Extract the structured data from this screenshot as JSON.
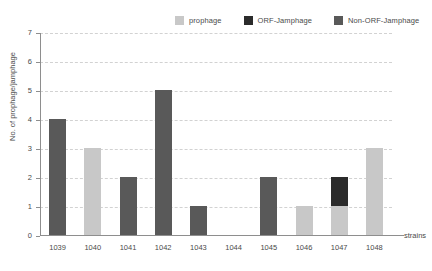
{
  "chart_data": {
    "type": "bar",
    "title": "",
    "subtitle": "",
    "xlabel": "strains",
    "ylabel": "No. of prophage/jamphage",
    "categories": [
      "1039",
      "1040",
      "1041",
      "1042",
      "1043",
      "1044",
      "1045",
      "1046",
      "1047",
      "1048"
    ],
    "ylim": [
      0,
      7
    ],
    "yticks": [
      "0",
      "1",
      "2",
      "3",
      "4",
      "5",
      "6",
      "7"
    ],
    "grid": "horizontal-dashed",
    "legend_position": "top-right",
    "stacked": true,
    "series": [
      {
        "name": "prophage",
        "color": "#c8c8c8",
        "values": [
          0,
          3,
          0,
          0,
          0,
          0,
          0,
          1,
          1,
          3
        ]
      },
      {
        "name": "ORF-Jamphage",
        "color": "#2b2b2b",
        "values": [
          0,
          0,
          0,
          0,
          0,
          0,
          0,
          0,
          1,
          0
        ]
      },
      {
        "name": "Non-ORF-Jamphage",
        "color": "#595959",
        "values": [
          4,
          0,
          2,
          5,
          1,
          0,
          2,
          0,
          0,
          0
        ]
      }
    ],
    "totals": [
      4,
      3,
      2,
      5,
      1,
      0,
      2,
      1,
      2,
      3
    ]
  },
  "legend": {
    "items": [
      {
        "label": "prophage",
        "color": "#c8c8c8"
      },
      {
        "label": "ORF-Jamphage",
        "color": "#2b2b2b"
      },
      {
        "label": "Non-ORF-Jamphage",
        "color": "#595959"
      }
    ]
  },
  "axes": {
    "y_title": "No. of prophage/jamphage",
    "x_title": "strains",
    "y_ticks": [
      "7",
      "6",
      "5",
      "4",
      "3",
      "2",
      "1",
      "0"
    ],
    "x_ticks": [
      "1039",
      "1040",
      "1041",
      "1042",
      "1043",
      "1044",
      "1045",
      "1046",
      "1047",
      "1048"
    ]
  },
  "colors": {
    "prophage": "#c8c8c8",
    "orf_jamphage": "#2b2b2b",
    "non_orf_jamphage": "#595959",
    "axis": "#8e8e8e",
    "gridline": "#d2d2d2",
    "text": "#4a4a4a",
    "background": "#ffffff"
  }
}
